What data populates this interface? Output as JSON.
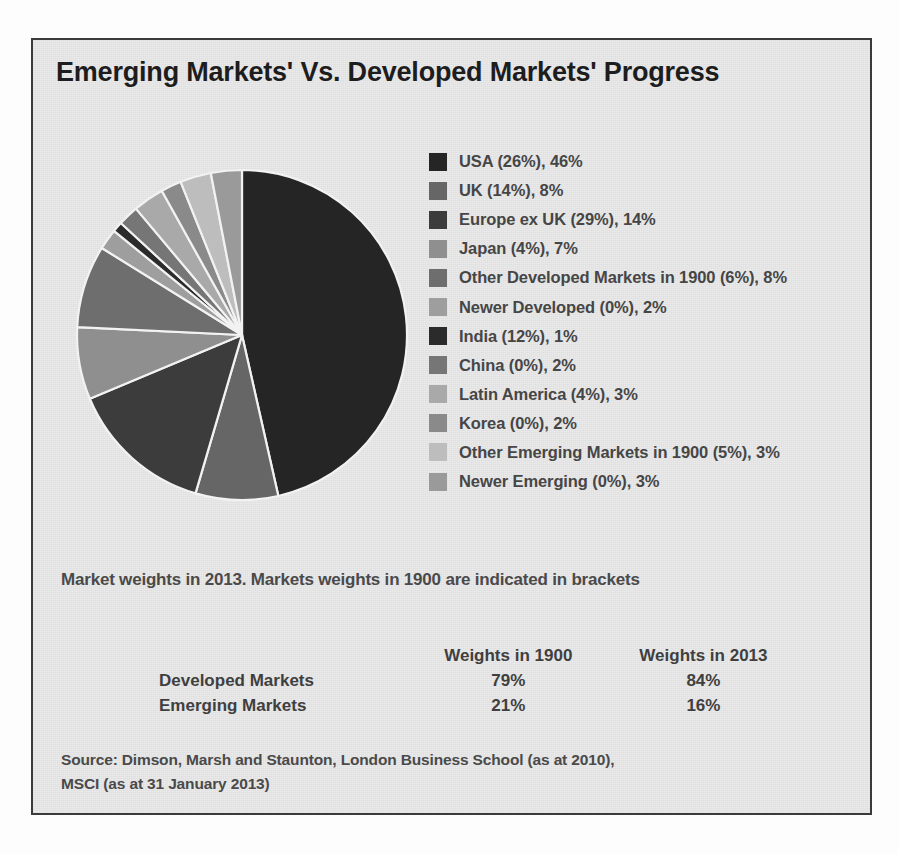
{
  "figure": {
    "title": "Emerging Markets' Vs. Developed Markets' Progress",
    "caption": "Market weights in 2013. Markets weights in 1900 are indicated in brackets",
    "border_color": "#3b3b3b",
    "background_color": "#e9e9e9"
  },
  "chart_data": {
    "type": "pie",
    "title": "Emerging Markets' Vs. Developed Markets' Progress",
    "subtitle": "Market weights in 2013. Markets weights in 1900 are indicated in brackets",
    "legend_position": "right",
    "value_unit": "percent",
    "labels": [
      "USA (26%), 46%",
      "UK (14%), 8%",
      "Europe ex UK (29%), 14%",
      "Japan (4%), 7%",
      "Other Developed Markets in 1900 (6%), 8%",
      "Newer Developed (0%), 2%",
      "India (12%), 1%",
      "China (0%), 2%",
      "Latin America (4%), 3%",
      "Korea (0%), 2%",
      "Other Emerging Markets in 1900 (5%), 3%",
      "Newer Emerging (0%), 3%"
    ],
    "categories": [
      "USA",
      "UK",
      "Europe ex UK",
      "Japan",
      "Other Developed Markets in 1900",
      "Newer Developed",
      "India",
      "China",
      "Latin America",
      "Korea",
      "Other Emerging Markets in 1900",
      "Newer Emerging"
    ],
    "values": [
      46,
      8,
      14,
      7,
      8,
      2,
      1,
      2,
      3,
      2,
      3,
      3
    ],
    "series": [
      {
        "name": "Weights in 1900",
        "values": [
          26,
          14,
          29,
          4,
          6,
          0,
          12,
          0,
          4,
          0,
          5,
          0
        ]
      },
      {
        "name": "Weights in 2013",
        "values": [
          46,
          8,
          14,
          7,
          8,
          2,
          1,
          2,
          3,
          2,
          3,
          3
        ]
      }
    ],
    "colors": [
      "#252525",
      "#666666",
      "#3c3c3c",
      "#8f8f8f",
      "#6e6e6e",
      "#9e9e9e",
      "#2b2b2b",
      "#767676",
      "#a9a9a9",
      "#8a8a8a",
      "#bdbdbd",
      "#9a9a9a"
    ]
  },
  "legend": {
    "items": [
      {
        "label": "USA (26%), 46%",
        "color": "#252525"
      },
      {
        "label": "UK (14%), 8%",
        "color": "#666666"
      },
      {
        "label": "Europe ex UK (29%), 14%",
        "color": "#3c3c3c"
      },
      {
        "label": "Japan (4%), 7%",
        "color": "#8f8f8f"
      },
      {
        "label": "Other Developed Markets in 1900 (6%), 8%",
        "color": "#6e6e6e"
      },
      {
        "label": "Newer Developed (0%), 2%",
        "color": "#9e9e9e"
      },
      {
        "label": "India (12%), 1%",
        "color": "#2b2b2b"
      },
      {
        "label": "China (0%), 2%",
        "color": "#767676"
      },
      {
        "label": "Latin America (4%), 3%",
        "color": "#a9a9a9"
      },
      {
        "label": "Korea (0%), 2%",
        "color": "#8a8a8a"
      },
      {
        "label": "Other Emerging Markets in 1900 (5%), 3%",
        "color": "#bdbdbd"
      },
      {
        "label": "Newer Emerging (0%), 3%",
        "color": "#9a9a9a"
      }
    ]
  },
  "weights_table": {
    "columns": [
      "",
      "Weights in 1900",
      "Weights in 2013"
    ],
    "rows": [
      {
        "label": "Developed Markets",
        "w1900": "79%",
        "w2013": "84%"
      },
      {
        "label": "Emerging Markets",
        "w1900": "21%",
        "w2013": "16%"
      }
    ]
  },
  "source": {
    "line1": "Source: Dimson, Marsh and Staunton, London Business School (as at 2010),",
    "line2": "MSCI (as at 31 January 2013)"
  }
}
